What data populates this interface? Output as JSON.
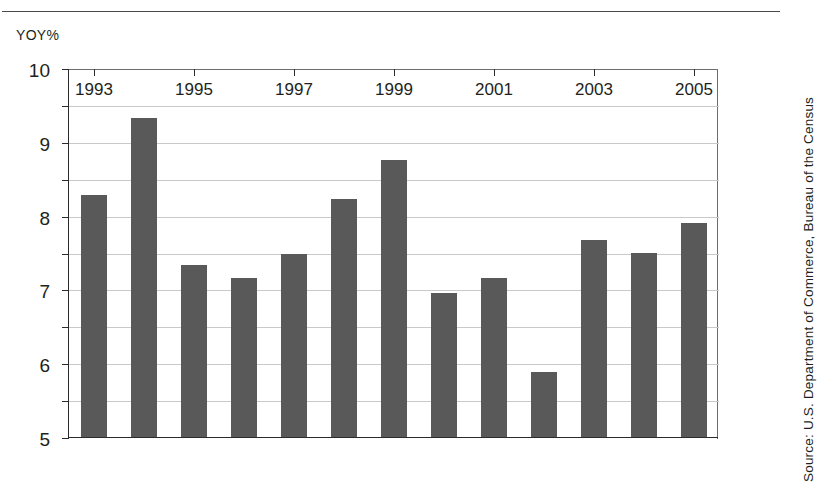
{
  "figure": {
    "title_remnant": "",
    "source_note": "Source: U.S. Department of Commerce, Bureau of the Census",
    "y_axis_caption": "YOY%"
  },
  "chart_data": {
    "type": "bar",
    "title": "",
    "xlabel": "",
    "ylabel": "YOY%",
    "ylim": [
      0,
      10
    ],
    "ytick_step": 1,
    "yticks": [
      "0",
      "1",
      "2",
      "3",
      "4",
      "5",
      "6",
      "7",
      "8",
      "9",
      "10"
    ],
    "grid": true,
    "legend": "none",
    "bar_color": "#595959",
    "categories": [
      "1993",
      "1994",
      "1995",
      "1996",
      "1997",
      "1998",
      "1999",
      "2000",
      "2001",
      "2002",
      "2003",
      "2004",
      "2005"
    ],
    "xtick_labels": [
      "1993",
      "1995",
      "1997",
      "1999",
      "2001",
      "2003",
      "2005"
    ],
    "values": [
      6.55,
      8.65,
      4.65,
      4.3,
      4.95,
      6.45,
      7.5,
      3.9,
      4.3,
      1.75,
      5.35,
      5.0,
      5.8
    ]
  }
}
